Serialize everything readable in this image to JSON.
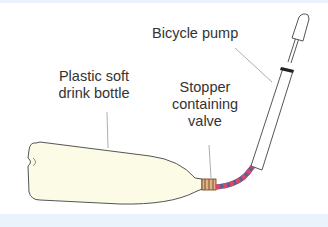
{
  "diagram": {
    "labels": {
      "pump": "Bicycle pump",
      "bottle_line1": "Plastic soft",
      "bottle_line2": "drink bottle",
      "stopper_line1": "Stopper",
      "stopper_line2": "containing",
      "stopper_line3": "valve"
    },
    "colors": {
      "bottle_fill": "#fbfbe6",
      "outline": "#555555",
      "tube_red": "#e0475f",
      "tube_blue": "#5a5f9a",
      "stopper": "#c8864a",
      "background_band": "#eaf2fb"
    }
  }
}
